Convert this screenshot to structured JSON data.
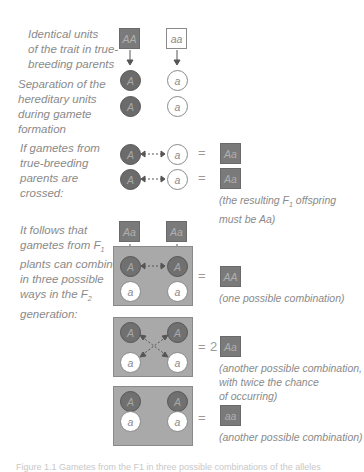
{
  "labels": {
    "row1": [
      "Identical units",
      "of the trait in true-",
      "breeding parents"
    ],
    "row2": [
      "Separation of the",
      "hereditary units",
      "during gamete",
      "formation"
    ],
    "row3": [
      "If gametes from",
      "true-breeding",
      "parents are",
      "crossed:"
    ],
    "row4": [
      "It follows that",
      "gametes from F",
      "plants can combine",
      "in three possible",
      "ways in the F",
      "generation:"
    ],
    "row4_subs": {
      "f1": "1",
      "f2": "2"
    }
  },
  "parents": {
    "dominant": "AA",
    "recessive": "aa"
  },
  "gametes": {
    "dominant": "A",
    "recessive": "a"
  },
  "f1_cross": {
    "rows": [
      {
        "left": "A",
        "right": "a",
        "equals": "=",
        "result": "Aa"
      },
      {
        "left": "A",
        "right": "a",
        "equals": "=",
        "result": "Aa"
      }
    ],
    "note_line1": "(the resulting F",
    "note_sub": "1",
    "note_line1_end": " offspring",
    "note_line2": "must be Aa)"
  },
  "f1_parents": [
    "Aa",
    "Aa"
  ],
  "f2_combinations": [
    {
      "gametes": [
        "A",
        "A",
        "a",
        "a"
      ],
      "equals": "=",
      "multiplier": "",
      "result": "AA",
      "note": [
        "(one possible combination)"
      ]
    },
    {
      "gametes": [
        "A",
        "A",
        "a",
        "a"
      ],
      "equals": "=",
      "multiplier": "2",
      "result": "Aa",
      "note": [
        "(another possible combination,",
        "with twice the chance",
        "of occurring)"
      ]
    },
    {
      "gametes": [
        "A",
        "A",
        "a",
        "a"
      ],
      "equals": "=",
      "multiplier": "",
      "result": "aa",
      "note": [
        "(another possible combination)"
      ]
    }
  ],
  "caption": "Figure 1.1  Gametes from the F1 in three possible combinations of the alleles",
  "colors": {
    "dominant": "#6b6b6b",
    "box": "#a9a9a9",
    "text": "#8a8a8a"
  }
}
